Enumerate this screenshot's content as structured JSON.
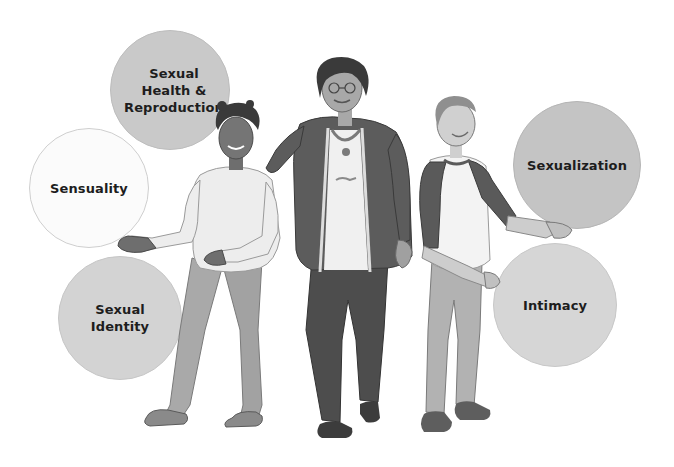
{
  "illustration": {
    "description": "Three people (a girl, an adult woman, and a boy) standing among five labeled circles",
    "figures": [
      {
        "role": "girl",
        "position": "left"
      },
      {
        "role": "adult-woman",
        "position": "center"
      },
      {
        "role": "boy",
        "position": "right"
      }
    ]
  },
  "bubbles": [
    {
      "id": "sexual-health-reproduction",
      "lines": [
        "Sexual",
        "Health &",
        "Reproduction"
      ],
      "cx": 170,
      "cy": 90,
      "r": 60,
      "fill": "#c9c9c9",
      "border": "#bdbdbd"
    },
    {
      "id": "sensuality",
      "lines": [
        "Sensuality"
      ],
      "cx": 89,
      "cy": 188,
      "r": 60,
      "fill": "#fbfbfb",
      "border": "#cfcfcf"
    },
    {
      "id": "sexual-identity",
      "lines": [
        "Sexual",
        "Identity"
      ],
      "cx": 120,
      "cy": 318,
      "r": 62,
      "fill": "#d3d3d3",
      "border": "#c6c6c6"
    },
    {
      "id": "sexualization",
      "lines": [
        "Sexualization"
      ],
      "cx": 577,
      "cy": 165,
      "r": 64,
      "fill": "#c4c4c4",
      "border": "#b5b5b5"
    },
    {
      "id": "intimacy",
      "lines": [
        "Intimacy"
      ],
      "cx": 555,
      "cy": 305,
      "r": 62,
      "fill": "#d6d6d6",
      "border": "#c8c8c8"
    }
  ],
  "colors": {
    "background": "#ffffff",
    "text": "#1d1d1d",
    "skin_dark": "#6e6e6e",
    "skin_light": "#bdbdbd",
    "shirt_light": "#eeeeee",
    "jeans_light": "#a9a9a9",
    "jacket_dark": "#5a5a5a",
    "pants_dark": "#4a4a4a",
    "shoe": "#6a6a6a",
    "hair_dark": "#3a3a3a",
    "hair_light": "#8f8f8f"
  }
}
